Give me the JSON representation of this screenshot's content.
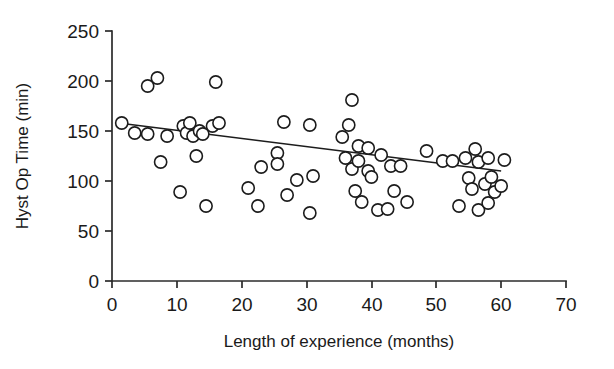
{
  "chart_data": {
    "type": "scatter",
    "title": "",
    "xlabel": "Length of experience (months)",
    "ylabel": "Hyst Op Time (min)",
    "xlim": [
      0,
      70
    ],
    "ylim": [
      0,
      250
    ],
    "xticks": [
      0,
      10,
      20,
      30,
      40,
      50,
      60,
      70
    ],
    "yticks": [
      0,
      50,
      100,
      150,
      200,
      250
    ],
    "grid": false,
    "legend": null,
    "marker": "open-circle",
    "points": [
      {
        "x": 1.5,
        "y": 158
      },
      {
        "x": 3.5,
        "y": 148
      },
      {
        "x": 5.5,
        "y": 195
      },
      {
        "x": 5.5,
        "y": 147
      },
      {
        "x": 7.0,
        "y": 203
      },
      {
        "x": 7.5,
        "y": 119
      },
      {
        "x": 8.5,
        "y": 145
      },
      {
        "x": 10.5,
        "y": 89
      },
      {
        "x": 11.0,
        "y": 155
      },
      {
        "x": 11.5,
        "y": 148
      },
      {
        "x": 12.0,
        "y": 158
      },
      {
        "x": 12.5,
        "y": 145
      },
      {
        "x": 13.0,
        "y": 125
      },
      {
        "x": 13.5,
        "y": 150
      },
      {
        "x": 14.0,
        "y": 147
      },
      {
        "x": 14.5,
        "y": 75
      },
      {
        "x": 15.5,
        "y": 155
      },
      {
        "x": 16.0,
        "y": 199
      },
      {
        "x": 16.5,
        "y": 158
      },
      {
        "x": 21.0,
        "y": 93
      },
      {
        "x": 22.5,
        "y": 75
      },
      {
        "x": 23.0,
        "y": 114
      },
      {
        "x": 25.5,
        "y": 128
      },
      {
        "x": 25.5,
        "y": 117
      },
      {
        "x": 26.5,
        "y": 159
      },
      {
        "x": 27.0,
        "y": 86
      },
      {
        "x": 28.5,
        "y": 101
      },
      {
        "x": 30.5,
        "y": 156
      },
      {
        "x": 30.5,
        "y": 68
      },
      {
        "x": 31.0,
        "y": 105
      },
      {
        "x": 35.5,
        "y": 144
      },
      {
        "x": 36.0,
        "y": 123
      },
      {
        "x": 36.5,
        "y": 156
      },
      {
        "x": 37.0,
        "y": 181
      },
      {
        "x": 37.0,
        "y": 112
      },
      {
        "x": 37.5,
        "y": 90
      },
      {
        "x": 38.0,
        "y": 135
      },
      {
        "x": 38.0,
        "y": 120
      },
      {
        "x": 38.5,
        "y": 79
      },
      {
        "x": 39.5,
        "y": 133
      },
      {
        "x": 39.5,
        "y": 110
      },
      {
        "x": 40.0,
        "y": 104
      },
      {
        "x": 41.0,
        "y": 71
      },
      {
        "x": 41.5,
        "y": 126
      },
      {
        "x": 42.5,
        "y": 72
      },
      {
        "x": 43.0,
        "y": 115
      },
      {
        "x": 43.5,
        "y": 90
      },
      {
        "x": 44.5,
        "y": 115
      },
      {
        "x": 45.5,
        "y": 79
      },
      {
        "x": 48.5,
        "y": 130
      },
      {
        "x": 51.0,
        "y": 120
      },
      {
        "x": 52.5,
        "y": 120
      },
      {
        "x": 53.5,
        "y": 75
      },
      {
        "x": 54.5,
        "y": 123
      },
      {
        "x": 55.0,
        "y": 103
      },
      {
        "x": 55.5,
        "y": 92
      },
      {
        "x": 56.0,
        "y": 132
      },
      {
        "x": 56.5,
        "y": 119
      },
      {
        "x": 56.5,
        "y": 71
      },
      {
        "x": 57.5,
        "y": 97
      },
      {
        "x": 58.0,
        "y": 123
      },
      {
        "x": 58.0,
        "y": 78
      },
      {
        "x": 58.5,
        "y": 104
      },
      {
        "x": 59.0,
        "y": 89
      },
      {
        "x": 60.0,
        "y": 95
      },
      {
        "x": 60.5,
        "y": 121
      }
    ],
    "trendline": {
      "label": "linear fit",
      "x_start": 1.0,
      "y_start": 158,
      "x_end": 60.0,
      "y_end": 110
    }
  },
  "colors": {
    "background": "#ffffff",
    "axis": "#2b2b2b",
    "marker_stroke": "#1c1c1c",
    "marker_fill": "#ffffff",
    "trendline": "#1c1c1c",
    "text": "#1a1a1a"
  }
}
